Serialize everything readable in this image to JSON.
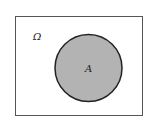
{
  "diagram": {
    "type": "venn",
    "universe": {
      "label": "Ω",
      "fill": "#ffffff",
      "stroke": "#444444"
    },
    "sets": [
      {
        "label": "A",
        "fill": "#b3b3b3",
        "stroke": "#222222"
      }
    ]
  }
}
